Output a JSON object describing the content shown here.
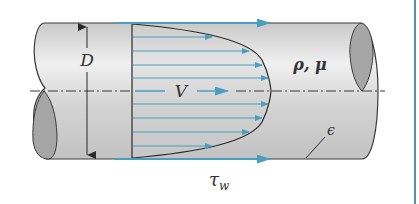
{
  "figure": {
    "labels": {
      "diameter": "D",
      "mean_velocity": "V",
      "fluid_properties": "ρ, μ",
      "roughness": "ϵ",
      "wall_shear_main": "τ",
      "wall_shear_sub": "w"
    },
    "colors": {
      "pipe_fill": "#d9d9d9",
      "pipe_end": "#a6a6a6",
      "outline": "#3a3a3a",
      "arrow_blue": "#4a9fc0",
      "border": "#5b8fa3"
    }
  }
}
